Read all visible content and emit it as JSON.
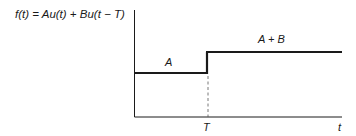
{
  "diagram": {
    "equation": "f(t) = Au(t) + Bu(t − T)",
    "axes": {
      "x_label": "t",
      "x_tick_label": "T",
      "y_label": ""
    },
    "segments": [
      {
        "label": "A",
        "from": "0",
        "to": "T",
        "level": "A"
      },
      {
        "label": "A + B",
        "from": "T",
        "to": "∞",
        "level": "A + B"
      }
    ],
    "marker": {
      "type": "dashed-vertical",
      "at": "T"
    },
    "colors": {
      "line": "#1a1a1a",
      "background": "#ffffff"
    }
  }
}
